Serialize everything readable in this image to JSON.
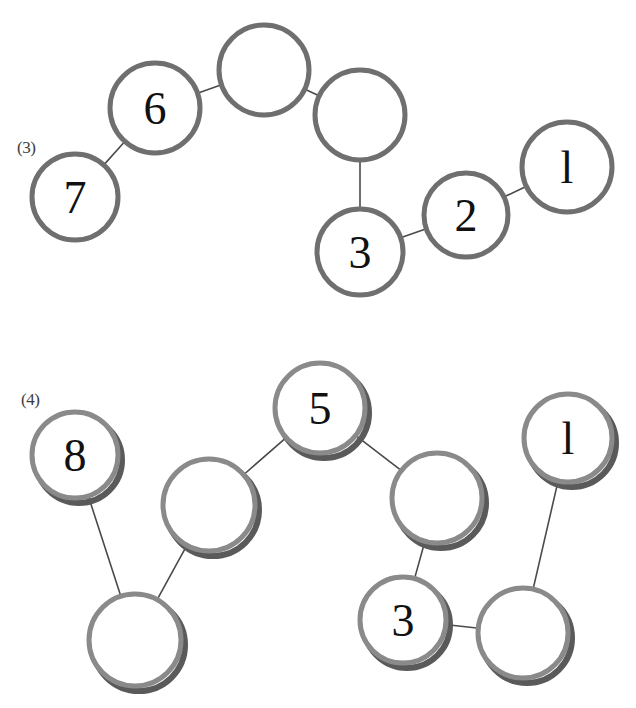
{
  "page": {
    "width": 636,
    "height": 708,
    "background": "#ffffff"
  },
  "style": {
    "node_stroke_light": "#8a8a8a",
    "node_stroke_dark": "#6f6f6f",
    "node_shadow": "#5a5a5a",
    "node_fill": "#ffffff",
    "edge_color": "#4a4a4a",
    "label_color": "#3c3c3c",
    "number_color": "#111111",
    "node_stroke_width": 5,
    "edge_stroke_width": 1.6
  },
  "panels": [
    {
      "id": "panel-3",
      "label": "(3)",
      "label_x": 17,
      "label_y": 139,
      "style": "flat",
      "nodes": [
        {
          "id": "n7",
          "label": "7",
          "cx": 75,
          "cy": 197,
          "r": 43
        },
        {
          "id": "n6",
          "label": "6",
          "cx": 155,
          "cy": 108,
          "r": 45
        },
        {
          "id": "a1",
          "label": "",
          "cx": 264,
          "cy": 70,
          "r": 45
        },
        {
          "id": "a2",
          "label": "",
          "cx": 360,
          "cy": 115,
          "r": 45
        },
        {
          "id": "n3",
          "label": "3",
          "cx": 360,
          "cy": 252,
          "r": 43
        },
        {
          "id": "n2",
          "label": "2",
          "cx": 466,
          "cy": 215,
          "r": 42
        },
        {
          "id": "n1",
          "label": "l",
          "cx": 567,
          "cy": 167,
          "r": 45
        }
      ],
      "edges": [
        {
          "from": "n7",
          "to": "n6"
        },
        {
          "from": "n6",
          "to": "a1"
        },
        {
          "from": "a1",
          "to": "a2"
        },
        {
          "from": "a2",
          "to": "n3"
        },
        {
          "from": "n3",
          "to": "n2"
        },
        {
          "from": "n2",
          "to": "n1"
        }
      ]
    },
    {
      "id": "panel-4",
      "label": "(4)",
      "label_x": 21,
      "label_y": 391,
      "style": "shadowed",
      "nodes": [
        {
          "id": "m8",
          "label": "8",
          "cx": 75,
          "cy": 455,
          "r": 43
        },
        {
          "id": "b1",
          "label": "",
          "cx": 209,
          "cy": 505,
          "r": 46
        },
        {
          "id": "m5",
          "label": "5",
          "cx": 320,
          "cy": 408,
          "r": 45
        },
        {
          "id": "b2",
          "label": "",
          "cx": 437,
          "cy": 498,
          "r": 45
        },
        {
          "id": "m1",
          "label": "l",
          "cx": 568,
          "cy": 438,
          "r": 44
        },
        {
          "id": "b3",
          "label": "",
          "cx": 135,
          "cy": 640,
          "r": 46
        },
        {
          "id": "m3",
          "label": "3",
          "cx": 403,
          "cy": 620,
          "r": 43
        },
        {
          "id": "b4",
          "label": "",
          "cx": 523,
          "cy": 633,
          "r": 45
        }
      ],
      "edges": [
        {
          "from": "m8",
          "to": "b3"
        },
        {
          "from": "b1",
          "to": "b3"
        },
        {
          "from": "b1",
          "to": "m5"
        },
        {
          "from": "m5",
          "to": "b2"
        },
        {
          "from": "b2",
          "to": "m3"
        },
        {
          "from": "m3",
          "to": "b4"
        },
        {
          "from": "b4",
          "to": "m1"
        }
      ]
    }
  ]
}
